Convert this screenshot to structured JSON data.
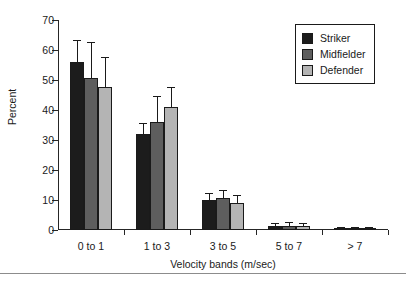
{
  "chart_data": {
    "type": "bar",
    "title": "",
    "xlabel": "Velocity bands (m/sec)",
    "ylabel": "Percent",
    "categories": [
      "0 to 1",
      "1 to 3",
      "3 to 5",
      "5 to 7",
      "> 7"
    ],
    "ylim": [
      0,
      70
    ],
    "yticks": [
      0,
      10,
      20,
      30,
      40,
      50,
      60,
      70
    ],
    "grid": false,
    "legend_position": "top-right",
    "series": [
      {
        "name": "Striker",
        "color": "#1c1c1c",
        "values": [
          56.0,
          32.0,
          10.0,
          1.2,
          0.3
        ],
        "errors": [
          7.0,
          3.5,
          2.0,
          0.8,
          0.3
        ]
      },
      {
        "name": "Midfielder",
        "color": "#5e5e5e",
        "values": [
          50.7,
          36.0,
          10.8,
          1.5,
          0.4
        ],
        "errors": [
          11.5,
          8.5,
          2.2,
          1.0,
          0.3
        ]
      },
      {
        "name": "Defender",
        "color": "#b4b4b4",
        "values": [
          47.8,
          41.0,
          9.0,
          1.2,
          0.3
        ],
        "errors": [
          9.7,
          6.5,
          2.5,
          0.9,
          0.3
        ]
      }
    ]
  },
  "axis": {
    "ylabel": "Percent",
    "xlabel": "Velocity bands (m/sec)",
    "ytick_labels": [
      "0",
      "10",
      "20",
      "30",
      "40",
      "50",
      "60",
      "70"
    ],
    "xtick_labels": [
      "0 to 1",
      "1 to 3",
      "3 to 5",
      "5 to 7",
      "> 7"
    ]
  },
  "legend": {
    "entries": [
      {
        "label": "Striker",
        "color": "#1c1c1c"
      },
      {
        "label": "Midfielder",
        "color": "#5e5e5e"
      },
      {
        "label": "Defender",
        "color": "#b4b4b4"
      }
    ]
  }
}
